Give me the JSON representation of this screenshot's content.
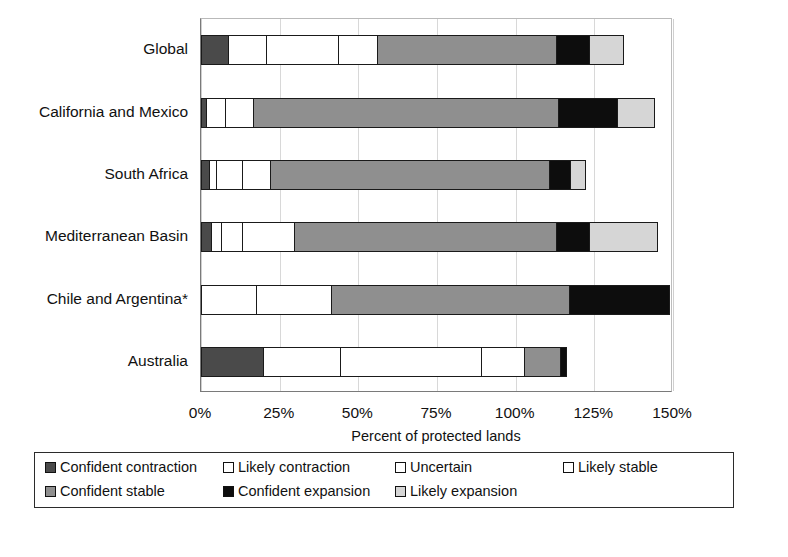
{
  "chart_data": {
    "type": "bar",
    "orientation": "horizontal",
    "stacked": true,
    "title": "",
    "xlabel": "Percent of protected lands",
    "ylabel": "",
    "xlim": [
      0,
      150
    ],
    "xticks": [
      "0%",
      "25%",
      "50%",
      "75%",
      "100%",
      "125%",
      "150%"
    ],
    "xtick_values": [
      0,
      25,
      50,
      75,
      100,
      125,
      150
    ],
    "grid": true,
    "legend_position": "bottom",
    "categories": [
      "Global",
      "California and Mexico",
      "South Africa",
      "Mediterranean Basin",
      "Chile and Argentina*",
      "Australia"
    ],
    "series": [
      {
        "name": "Confident contraction",
        "color": "#4a4a4a",
        "values": [
          9,
          2,
          3,
          3.5,
          0,
          20
        ]
      },
      {
        "name": "Likely contraction",
        "color": "#ffffff",
        "values": [
          12.5,
          6.5,
          2.5,
          3.5,
          18,
          25
        ]
      },
      {
        "name": "Uncertain",
        "color": "#ffffff",
        "values": [
          23,
          9,
          8.5,
          7,
          24,
          45
        ]
      },
      {
        "name": "Likely stable",
        "color": "#ffffff",
        "values": [
          13,
          0,
          9.5,
          17,
          0,
          14
        ]
      },
      {
        "name": "Confident stable",
        "color": "#8f8f8f",
        "values": [
          57,
          97.5,
          89,
          83.5,
          76,
          12
        ]
      },
      {
        "name": "Confident expansion",
        "color": "#0d0d0d",
        "values": [
          11,
          19,
          7,
          11,
          32,
          2
        ]
      },
      {
        "name": "Likely expansion",
        "color": "#d6d6d6",
        "values": [
          11,
          12,
          5,
          22,
          0,
          0
        ]
      }
    ],
    "totals": [
      136.5,
      146,
      124.5,
      147.5,
      150,
      118
    ]
  },
  "legend": {
    "items": [
      {
        "label": "Confident contraction",
        "color": "#4a4a4a"
      },
      {
        "label": "Likely contraction",
        "color": "#ffffff"
      },
      {
        "label": "Uncertain",
        "color": "#ffffff"
      },
      {
        "label": "Likely stable",
        "color": "#ffffff"
      },
      {
        "label": "Confident stable",
        "color": "#8f8f8f"
      },
      {
        "label": "Confident expansion",
        "color": "#0d0d0d"
      },
      {
        "label": "Likely expansion",
        "color": "#d6d6d6"
      }
    ]
  },
  "footnote": ""
}
